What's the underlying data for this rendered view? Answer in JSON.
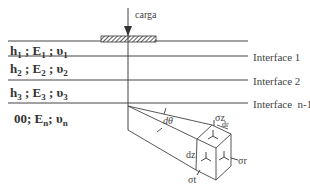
{
  "load": {
    "label": "carga"
  },
  "layers": [
    {
      "h": "h",
      "h_sub": "1",
      "E": "E",
      "E_sub": "1",
      "nu": "υ",
      "nu_sub": "1",
      "sep": " ; "
    },
    {
      "h": "h",
      "h_sub": "2",
      "E": "E",
      "E_sub": "2",
      "nu": "υ",
      "nu_sub": "2",
      "sep": " ; "
    },
    {
      "h": "h",
      "h_sub": "3",
      "E": "E",
      "E_sub": "3",
      "nu": "υ",
      "nu_sub": "3",
      "sep": " ; "
    },
    {
      "h": "00",
      "h_sub": "",
      "E": "E",
      "E_sub": "n",
      "nu": "υ",
      "nu_sub": "n",
      "sep": "; "
    }
  ],
  "interfaces": [
    {
      "label": "Interface 1"
    },
    {
      "label": "Interface 2"
    },
    {
      "label": "Interface  n-1"
    }
  ],
  "element": {
    "angle_label": "dθ",
    "dz_label": "dz",
    "dr_label": "dr",
    "sigma_z": "σz",
    "sigma_r": "σr",
    "sigma_t": "σt"
  },
  "colors": {
    "line": "#444444",
    "text": "#333333",
    "hatch": "#333333"
  }
}
